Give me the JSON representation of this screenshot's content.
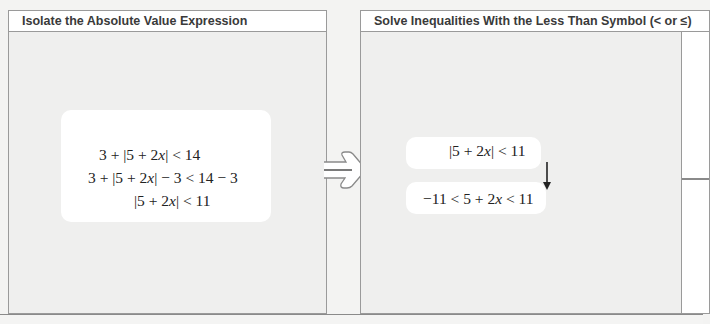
{
  "panels": [
    {
      "title": "Isolate the Absolute Value Expression",
      "lines": [
        {
          "prefix": "3 + |5 + 2",
          "var": "x",
          "suffix": "| < 14"
        },
        {
          "prefix": "3 + |5 + 2",
          "var": "x",
          "suffix": "| − 3 < 14 − 3"
        },
        {
          "prefix": "|5 + 2",
          "var": "x",
          "suffix": "| < 11"
        }
      ]
    },
    {
      "title": "Solve Inequalities With the Less Than Symbol (< or ≤)",
      "lines": [
        {
          "prefix": "|5 + 2",
          "var": "x",
          "suffix": "| < 11"
        },
        {
          "prefix": "−11 < 5 + 2",
          "var": "x",
          "suffix": " < 11"
        }
      ]
    }
  ],
  "icons": {
    "connector": "right-arrow-icon",
    "step": "down-arrow-icon"
  },
  "colors": {
    "border": "#9a9a9a",
    "panel_bg": "#efefee",
    "header_bg": "#ffffff",
    "text": "#222222"
  }
}
